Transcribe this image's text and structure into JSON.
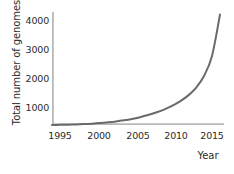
{
  "chart_data": {
    "type": "line",
    "title": "",
    "subtitle": "",
    "xlabel": "Year",
    "ylabel": "Total number of genomes",
    "xlim": [
      1994,
      2015.5
    ],
    "ylim": [
      0,
      4500
    ],
    "xticks": [
      1995,
      2000,
      2005,
      2010,
      2015
    ],
    "xtick_labels": [
      "1995",
      "2000",
      "2005",
      "2010",
      "2015"
    ],
    "yticks": [
      1000,
      2000,
      3000,
      4000
    ],
    "ytick_labels": [
      "1000",
      "2000",
      "3000",
      "4000"
    ],
    "grid": false,
    "legend": false,
    "legend_position": "none",
    "annotations": [],
    "series": [
      {
        "name": "Total number of genomes",
        "color": "#6a6a6a",
        "x": [
          1994,
          1995,
          1996,
          1997,
          1998,
          1999,
          2000,
          2001,
          2002,
          2003,
          2004,
          2005,
          2006,
          2007,
          2008,
          2009,
          2010,
          2011,
          2012,
          2013,
          2014,
          2015
        ],
        "values": [
          0,
          5,
          12,
          22,
          35,
          52,
          75,
          105,
          140,
          185,
          240,
          310,
          395,
          495,
          615,
          760,
          940,
          1170,
          1480,
          1950,
          2750,
          4400
        ]
      }
    ]
  },
  "axes": {
    "x_title": "Year",
    "y_title": "Total number of genomes",
    "axis_color": "#b8b8b8",
    "text_color": "#2b2b2b",
    "background": "#ffffff"
  },
  "x_tick_labels": [
    "1995",
    "2000",
    "2005",
    "2010",
    "2015"
  ],
  "y_tick_labels": [
    "4000",
    "3000",
    "2000",
    "1000"
  ]
}
